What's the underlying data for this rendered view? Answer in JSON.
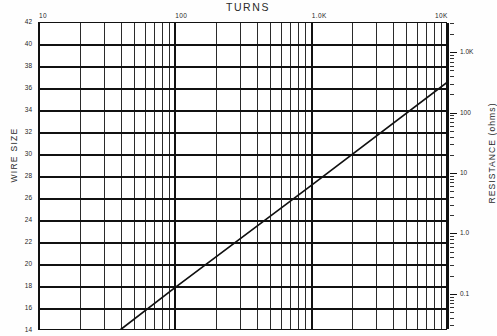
{
  "chart_data": {
    "type": "line",
    "title": "TURNS",
    "xlabel": "TURNS",
    "ylabel": "WIRE SIZE",
    "y2label": "RESISTANCE (ohms)",
    "x_scale": "log",
    "y_scale": "linear",
    "y2_scale": "log",
    "xlim": [
      10,
      10000
    ],
    "ylim": [
      14,
      42
    ],
    "y2lim": [
      0.03,
      3000
    ],
    "grid": true,
    "legend": "none",
    "x_tick_labels": [
      "10",
      "100",
      "1.0K",
      "10K"
    ],
    "x_tick_values": [
      10,
      100,
      1000,
      10000
    ],
    "y_tick_labels": [
      "42",
      "40",
      "38",
      "36",
      "34",
      "32",
      "30",
      "28",
      "26",
      "24",
      "22",
      "20",
      "18",
      "16",
      "14"
    ],
    "y_tick_values": [
      42,
      40,
      38,
      36,
      34,
      32,
      30,
      28,
      26,
      24,
      22,
      20,
      18,
      16,
      14
    ],
    "y2_tick_labels": [
      "1.0K",
      "100",
      "10",
      "1.0",
      "0.1"
    ],
    "y2_tick_values": [
      1000,
      100,
      10,
      1.0,
      0.1
    ],
    "series": [
      {
        "name": "wire size vs turns",
        "points": [
          {
            "turns": 40,
            "wire_size": 14
          },
          {
            "turns": 100,
            "wire_size": 17.8
          },
          {
            "turns": 1000,
            "wire_size": 27.1
          },
          {
            "turns": 10000,
            "wire_size": 36.5
          },
          {
            "turns": 10000,
            "wire_size": 42
          }
        ],
        "endpoints": {
          "start": [
            40,
            14
          ],
          "end": [
            10000,
            42
          ]
        }
      }
    ],
    "annotations": []
  },
  "labels": {
    "title": "TURNS",
    "y_left": "WIRE SIZE",
    "y_right": "RESISTANCE (ohms)"
  }
}
